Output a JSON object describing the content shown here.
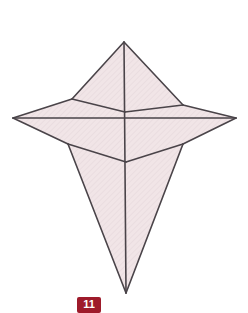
{
  "figure": {
    "label": "11",
    "label_color": "#ffffff",
    "badge_color": "#9e1b2b",
    "background_color": "#ffffff",
    "face_fill_light": "#f2e6e8",
    "face_fill_mid": "#ece0e2",
    "face_fill_dark": "#e6d8db",
    "edge_color": "#4a4449",
    "edge_width": 1.6,
    "shape_name": "elongated-bipyramid-wireframe",
    "vertices": {
      "top_apex": [
        124,
        42
      ],
      "left_tip": [
        13,
        118
      ],
      "right_tip": [
        236,
        118
      ],
      "bottom_apex": [
        126,
        293
      ],
      "upper_left_waist": [
        72,
        99
      ],
      "upper_right_waist": [
        183,
        105
      ],
      "lower_left_waist": [
        68,
        144
      ],
      "lower_right_waist": [
        183,
        144
      ],
      "center_upper": [
        125,
        112
      ],
      "center_lower": [
        126,
        162
      ]
    },
    "faces": [
      {
        "name": "top-left-face",
        "points": "124,42 72,99 125,112"
      },
      {
        "name": "top-right-face",
        "points": "124,42 125,112 183,105"
      },
      {
        "name": "upper-left-wing",
        "points": "72,99 13,118 125,118 125,112"
      },
      {
        "name": "upper-right-wing",
        "points": "183,105 236,118 125,118 125,112"
      },
      {
        "name": "lower-left-wing",
        "points": "13,118 68,144 126,162 125,118"
      },
      {
        "name": "lower-right-wing",
        "points": "236,118 183,144 126,162 125,118"
      },
      {
        "name": "bottom-left-face",
        "points": "68,144 126,293 126,162"
      },
      {
        "name": "bottom-right-face",
        "points": "183,144 126,293 126,162"
      }
    ],
    "edges": [
      {
        "name": "edge-apex-to-upper-left-waist",
        "from": [
          124,
          42
        ],
        "to": [
          72,
          99
        ]
      },
      {
        "name": "edge-apex-to-upper-right-waist",
        "from": [
          124,
          42
        ],
        "to": [
          183,
          105
        ]
      },
      {
        "name": "edge-upper-left-waist-to-center",
        "from": [
          72,
          99
        ],
        "to": [
          125,
          112
        ]
      },
      {
        "name": "edge-center-to-upper-right-waist",
        "from": [
          125,
          112
        ],
        "to": [
          183,
          105
        ]
      },
      {
        "name": "edge-upper-left-waist-to-left-tip",
        "from": [
          72,
          99
        ],
        "to": [
          13,
          118
        ]
      },
      {
        "name": "edge-upper-right-waist-to-right-tip",
        "from": [
          183,
          105
        ],
        "to": [
          236,
          118
        ]
      },
      {
        "name": "edge-left-tip-to-lower-left-waist",
        "from": [
          13,
          118
        ],
        "to": [
          68,
          144
        ]
      },
      {
        "name": "edge-right-tip-to-lower-right-waist",
        "from": [
          236,
          118
        ],
        "to": [
          183,
          144
        ]
      },
      {
        "name": "edge-lower-left-waist-to-center-lower",
        "from": [
          68,
          144
        ],
        "to": [
          126,
          162
        ]
      },
      {
        "name": "edge-center-lower-to-lower-right-waist",
        "from": [
          126,
          162
        ],
        "to": [
          183,
          144
        ]
      },
      {
        "name": "edge-lower-left-waist-to-bottom-apex",
        "from": [
          68,
          144
        ],
        "to": [
          126,
          293
        ]
      },
      {
        "name": "edge-lower-right-waist-to-bottom-apex",
        "from": [
          183,
          144
        ],
        "to": [
          126,
          293
        ]
      },
      {
        "name": "edge-horizontal-equator",
        "from": [
          13,
          118
        ],
        "to": [
          236,
          118
        ]
      },
      {
        "name": "edge-vertical-axis",
        "from": [
          124,
          42
        ],
        "to": [
          126,
          293
        ]
      }
    ]
  }
}
